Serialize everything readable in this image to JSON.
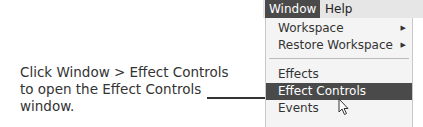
{
  "caption": {
    "lines": [
      "Click Window > Effect Controls",
      "to open the Effect Controls",
      "window."
    ]
  },
  "menubar": {
    "items": [
      {
        "label": "Window",
        "active": true
      },
      {
        "label": "Help",
        "active": false
      }
    ]
  },
  "menu": {
    "items": [
      {
        "label": "Workspace",
        "submenu_icon": "chevron-right-icon"
      },
      {
        "label": "Restore Workspace",
        "submenu_icon": "chevron-right-icon"
      },
      {
        "label": "Effects"
      },
      {
        "label": "Effect Controls",
        "highlighted": true
      },
      {
        "label": "Events"
      }
    ]
  },
  "colors": {
    "highlight": "#4a4a4a",
    "menu_bg": "#f4f4f4",
    "menubar_bg": "#e6e6e6"
  }
}
